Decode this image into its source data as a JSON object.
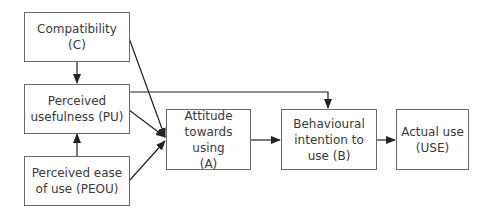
{
  "diagram": {
    "type": "flowchart",
    "nodes": [
      {
        "id": "C",
        "label": "Compatibility (C)",
        "lines": [
          "Compatibility",
          "(C)"
        ]
      },
      {
        "id": "PU",
        "label": "Perceived usefulness (PU)",
        "lines": [
          "Perceived",
          "usefulness (PU)"
        ]
      },
      {
        "id": "PEOU",
        "label": "Perceived ease of use (PEOU)",
        "lines": [
          "Perceived ease",
          "of use (PEOU)"
        ]
      },
      {
        "id": "A",
        "label": "Attitude towards using (A)",
        "lines": [
          "Attitude",
          "towards using",
          "(A)"
        ]
      },
      {
        "id": "B",
        "label": "Behavioural intention to use (B)",
        "lines": [
          "Behavioural",
          "intention to",
          "use (B)"
        ]
      },
      {
        "id": "USE",
        "label": "Actual use (USE)",
        "lines": [
          "Actual use",
          "(USE)"
        ]
      }
    ],
    "edges": [
      {
        "from": "C",
        "to": "PU"
      },
      {
        "from": "C",
        "to": "A"
      },
      {
        "from": "PU",
        "to": "A"
      },
      {
        "from": "PU",
        "to": "B"
      },
      {
        "from": "PEOU",
        "to": "PU"
      },
      {
        "from": "PEOU",
        "to": "A"
      },
      {
        "from": "A",
        "to": "B"
      },
      {
        "from": "B",
        "to": "USE"
      }
    ]
  }
}
